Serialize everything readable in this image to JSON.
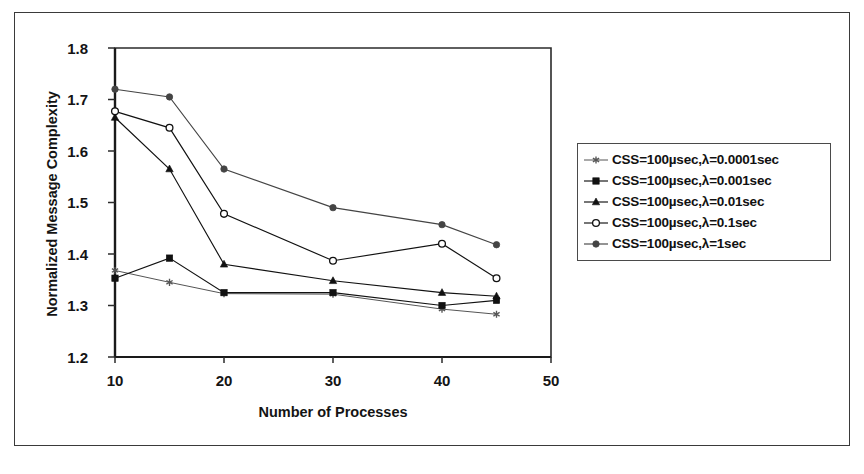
{
  "chart_data": {
    "type": "line",
    "title": "",
    "xlabel": "Number of Processes",
    "ylabel": "Normalized Message Complexity",
    "x": [
      10,
      15,
      20,
      30,
      40,
      45
    ],
    "xlim": [
      10,
      50
    ],
    "ylim": [
      1.2,
      1.8
    ],
    "xticks": [
      10,
      20,
      30,
      40,
      50
    ],
    "xtick_labels": [
      "10",
      "20",
      "30",
      "40",
      "50"
    ],
    "yticks": [
      1.2,
      1.3,
      1.4,
      1.5,
      1.6,
      1.7,
      1.8
    ],
    "ytick_labels": [
      "1.2",
      "1.3",
      "1.4",
      "1.5",
      "1.6",
      "1.7",
      "1.8"
    ],
    "grid": false,
    "legend_position": "right",
    "series": [
      {
        "name": "CSS=100µsec,λ=0.0001sec",
        "marker": "star",
        "color": "#555555",
        "values": [
          1.368,
          1.345,
          1.323,
          1.322,
          1.293,
          1.283
        ]
      },
      {
        "name": "CSS=100µsec,λ=0.001sec",
        "marker": "filled-square",
        "color": "#111111",
        "values": [
          1.353,
          1.392,
          1.325,
          1.325,
          1.3,
          1.31
        ]
      },
      {
        "name": "CSS=100µsec,λ=0.01sec",
        "marker": "filled-triangle",
        "color": "#111111",
        "values": [
          1.665,
          1.565,
          1.38,
          1.348,
          1.325,
          1.318
        ]
      },
      {
        "name": "CSS=100µsec,λ=0.1sec",
        "marker": "open-circle",
        "color": "#111111",
        "values": [
          1.677,
          1.645,
          1.478,
          1.387,
          1.42,
          1.353
        ]
      },
      {
        "name": "CSS=100µsec,λ=1sec",
        "marker": "filled-circle",
        "color": "#444444",
        "values": [
          1.72,
          1.705,
          1.565,
          1.49,
          1.457,
          1.418
        ]
      }
    ]
  },
  "legend": {
    "items": [
      "CSS=100µsec,λ=0.0001sec",
      "CSS=100µsec,λ=0.001sec",
      "CSS=100µsec,λ=0.01sec",
      "CSS=100µsec,λ=0.1sec",
      "CSS=100µsec,λ=1sec"
    ]
  },
  "axes": {
    "y_title": "Normalized Message Complexity",
    "x_title": "Number of Processes"
  }
}
